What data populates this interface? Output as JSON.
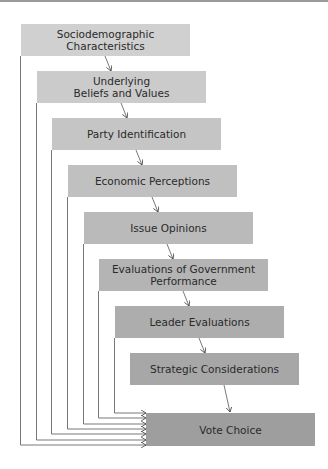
{
  "diagram": {
    "type": "causal-funnel",
    "boxes": [
      {
        "label": "Sociodemographic\nCharacteristics",
        "line1": "Sociodemographic",
        "line2": "Characteristics",
        "color": "#d0d0d0"
      },
      {
        "label": "Underlying\nBeliefs and Values",
        "line1": "Underlying",
        "line2": "Beliefs and Values",
        "color": "#cbcbcb"
      },
      {
        "label": "Party Identification",
        "line1": "Party Identification",
        "line2": "",
        "color": "#c5c5c5"
      },
      {
        "label": "Economic Perceptions",
        "line1": "Economic Perceptions",
        "line2": "",
        "color": "#c0c0c0"
      },
      {
        "label": "Issue Opinions",
        "line1": "Issue Opinions",
        "line2": "",
        "color": "#bababa"
      },
      {
        "label": "Evaluations of Government\nPerformance",
        "line1": "Evaluations of Government",
        "line2": "Performance",
        "color": "#b4b4b4"
      },
      {
        "label": "Leader Evaluations",
        "line1": "Leader Evaluations",
        "line2": "",
        "color": "#adadad"
      },
      {
        "label": "Strategic Considerations",
        "line1": "Strategic Considerations",
        "line2": "",
        "color": "#a7a7a7"
      },
      {
        "label": "Vote Choice",
        "line1": "Vote Choice",
        "line2": "",
        "color": "#9e9e9e"
      }
    ],
    "edges": "Each box points to the next box (diagonal arrow); boxes 1–7 also have direct feedback lines from their left edge to Vote Choice.",
    "line_color": "#555555"
  }
}
